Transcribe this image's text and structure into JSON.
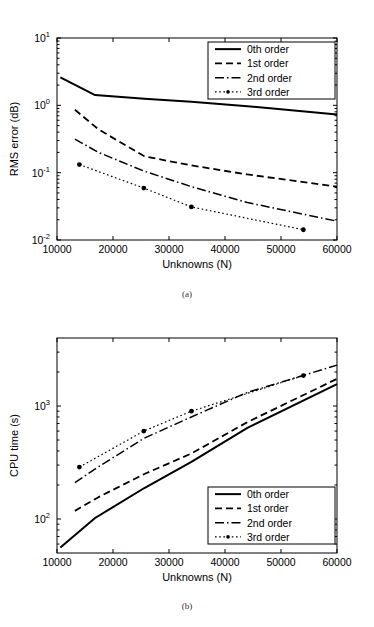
{
  "figure": {
    "caption_a": "(a)",
    "caption_b": "(b)",
    "line_color": "#000000",
    "background": "#ffffff"
  },
  "chart_data": [
    {
      "id": "rms-error",
      "type": "line",
      "title": "",
      "panel_label": "(a)",
      "xlabel": "Unknowns (N)",
      "ylabel": "RMS error (dB)",
      "xscale": "linear",
      "yscale": "log",
      "xlim": [
        10000,
        60000
      ],
      "ylim": [
        0.01,
        10
      ],
      "grid": false,
      "xticks": [
        10000,
        20000,
        30000,
        40000,
        50000,
        60000
      ],
      "xtick_labels": [
        "10000",
        "20000",
        "30000",
        "40000",
        "50000",
        "60000"
      ],
      "yticks": [
        0.01,
        0.1,
        1,
        10
      ],
      "ytick_labels": [
        "10^-2",
        "10^-1",
        "10^0",
        "10^1"
      ],
      "legend_position": "upper right",
      "series": [
        {
          "name": "0th order",
          "style": "solid",
          "width": 2.0,
          "markers": false,
          "x": [
            10600,
            16800,
            25600,
            34000,
            44000,
            60000
          ],
          "y": [
            2.6,
            1.42,
            1.25,
            1.13,
            0.97,
            0.73
          ]
        },
        {
          "name": "1st order",
          "style": "dashed",
          "width": 1.8,
          "markers": false,
          "x": [
            13200,
            17400,
            25600,
            34000,
            44000,
            60000
          ],
          "y": [
            0.86,
            0.44,
            0.175,
            0.128,
            0.094,
            0.062
          ]
        },
        {
          "name": "2nd order",
          "style": "dashdot",
          "width": 1.5,
          "markers": false,
          "x": [
            13200,
            17400,
            25600,
            34000,
            44000,
            60000
          ],
          "y": [
            0.315,
            0.2,
            0.105,
            0.062,
            0.036,
            0.019
          ]
        },
        {
          "name": "3rd order",
          "style": "dotted",
          "width": 1.2,
          "markers": true,
          "x": [
            14000,
            25500,
            34000,
            54000
          ],
          "y": [
            0.132,
            0.059,
            0.031,
            0.0142
          ]
        }
      ]
    },
    {
      "id": "cpu-time",
      "type": "line",
      "title": "",
      "panel_label": "(b)",
      "xlabel": "Unknowns (N)",
      "ylabel": "CPU time (s)",
      "xscale": "linear",
      "yscale": "log",
      "xlim": [
        10000,
        60000
      ],
      "ylim": [
        50,
        4000
      ],
      "grid": false,
      "xticks": [
        10000,
        20000,
        30000,
        40000,
        50000,
        60000
      ],
      "xtick_labels": [
        "10000",
        "20000",
        "30000",
        "40000",
        "50000",
        "60000"
      ],
      "yticks": [
        100,
        1000
      ],
      "ytick_labels": [
        "10^2",
        "10^3"
      ],
      "legend_position": "lower right",
      "series": [
        {
          "name": "0th order",
          "style": "solid",
          "width": 2.0,
          "markers": false,
          "x": [
            10600,
            16800,
            25600,
            34000,
            44000,
            60000
          ],
          "y": [
            56,
            102,
            188,
            320,
            640,
            1560
          ]
        },
        {
          "name": "1st order",
          "style": "dashed",
          "width": 1.8,
          "markers": false,
          "x": [
            13200,
            17400,
            25600,
            34000,
            44000,
            60000
          ],
          "y": [
            118,
            156,
            250,
            380,
            720,
            1740
          ]
        },
        {
          "name": "2nd order",
          "style": "dashdot",
          "width": 1.5,
          "markers": false,
          "x": [
            13200,
            17400,
            25600,
            34000,
            44000,
            60000
          ],
          "y": [
            210,
            290,
            520,
            800,
            1320,
            2300
          ]
        },
        {
          "name": "3rd order",
          "style": "dotted",
          "width": 1.2,
          "markers": true,
          "x": [
            14000,
            25500,
            34000,
            54000
          ],
          "y": [
            288,
            600,
            900,
            1860
          ]
        }
      ]
    }
  ]
}
